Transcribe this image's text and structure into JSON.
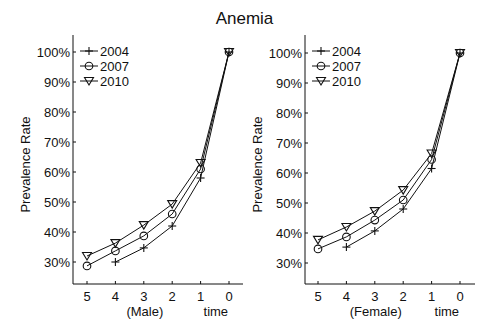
{
  "title": "Anemia",
  "chart_data": [
    {
      "type": "line",
      "panel": "Male",
      "title": "Anemia",
      "xlabel": "time",
      "xsublabel": "(Male)",
      "ylabel": "Prevalence Rate",
      "x": [
        5,
        4,
        3,
        2,
        1,
        0
      ],
      "x_tick_labels": [
        "5",
        "4",
        "3",
        "2",
        "1",
        "0"
      ],
      "y_tick_labels": [
        "30%",
        "40%",
        "50%",
        "60%",
        "70%",
        "80%",
        "90%",
        "100%"
      ],
      "ylim": [
        0.25,
        1.05
      ],
      "series": [
        {
          "name": "2004",
          "marker": "plus",
          "x": [
            4,
            3,
            2,
            1,
            0
          ],
          "values": [
            0.3,
            0.347,
            0.42,
            0.58,
            1.0
          ]
        },
        {
          "name": "2007",
          "marker": "circle",
          "x": [
            5,
            4,
            3,
            2,
            1,
            0
          ],
          "values": [
            0.287,
            0.337,
            0.387,
            0.46,
            0.61,
            1.0
          ]
        },
        {
          "name": "2010",
          "marker": "triangle-down",
          "x": [
            5,
            4,
            3,
            2,
            1,
            0
          ],
          "values": [
            0.32,
            0.363,
            0.423,
            0.493,
            0.63,
            1.0
          ]
        }
      ],
      "legend_position": "upper left",
      "grid": false
    },
    {
      "type": "line",
      "panel": "Female",
      "title": "Anemia",
      "xlabel": "time",
      "xsublabel": "(Female)",
      "ylabel": "Prevalence Rate",
      "x": [
        5,
        4,
        3,
        2,
        1,
        0
      ],
      "x_tick_labels": [
        "5",
        "4",
        "3",
        "2",
        "1",
        "0"
      ],
      "y_tick_labels": [
        "30%",
        "40%",
        "50%",
        "60%",
        "70%",
        "80%",
        "90%",
        "100%"
      ],
      "ylim": [
        0.25,
        1.05
      ],
      "series": [
        {
          "name": "2004",
          "marker": "plus",
          "x": [
            4,
            3,
            2,
            1,
            0
          ],
          "values": [
            0.353,
            0.407,
            0.48,
            0.615,
            1.0
          ]
        },
        {
          "name": "2007",
          "marker": "circle",
          "x": [
            5,
            4,
            3,
            2,
            1,
            0
          ],
          "values": [
            0.347,
            0.387,
            0.443,
            0.51,
            0.645,
            1.0
          ]
        },
        {
          "name": "2010",
          "marker": "triangle-down",
          "x": [
            5,
            4,
            3,
            2,
            1,
            0
          ],
          "values": [
            0.377,
            0.42,
            0.473,
            0.543,
            0.665,
            1.0
          ]
        }
      ],
      "legend_position": "upper left",
      "grid": false
    }
  ]
}
